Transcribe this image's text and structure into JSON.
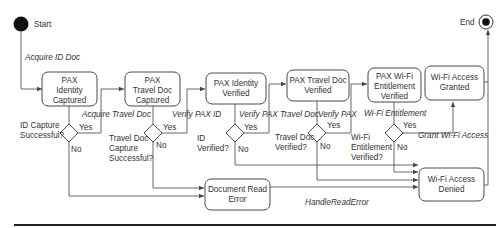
{
  "diagram": {
    "type": "uml-state-machine",
    "start": {
      "label": "Start"
    },
    "end": {
      "label": "End"
    },
    "states": [
      {
        "id": "s1",
        "lines": [
          "PAX",
          "Identity",
          "Captured"
        ]
      },
      {
        "id": "s2",
        "lines": [
          "PAX",
          "Travel Doc",
          "Captured"
        ]
      },
      {
        "id": "s3",
        "lines": [
          "PAX Identity",
          "Verified"
        ]
      },
      {
        "id": "s4",
        "lines": [
          "PAX Travel Doc",
          "Verified"
        ]
      },
      {
        "id": "s5",
        "lines": [
          "PAX Wi-Fi",
          "Entitlement",
          "Verified"
        ]
      },
      {
        "id": "s6",
        "lines": [
          "Wi-Fi Access",
          "Granted"
        ]
      },
      {
        "id": "err",
        "lines": [
          "Document Read",
          "Error"
        ]
      },
      {
        "id": "denied",
        "lines": [
          "Wi-Fi Access",
          "Denied"
        ]
      }
    ],
    "decisions": [
      {
        "id": "d1",
        "lines": [
          "ID Capture",
          "Successful?"
        ],
        "yes": "Yes",
        "no": "No"
      },
      {
        "id": "d2",
        "lines": [
          "Travel Doc",
          "Capture",
          "Successful?"
        ],
        "yes": "Yes",
        "no": "No"
      },
      {
        "id": "d3",
        "lines": [
          "ID",
          "Verified?"
        ],
        "yes": "Yes",
        "no": "No"
      },
      {
        "id": "d4",
        "lines": [
          "Travel Doc",
          "Verified?"
        ],
        "yes": "Yes",
        "no": "No"
      },
      {
        "id": "d5",
        "lines": [
          "Wi-Fi",
          "Entitlement",
          "Verified?"
        ],
        "yes": "Yes",
        "no": "No"
      }
    ],
    "transitions": {
      "acquire_id": "Acquire ID Doc",
      "acquire_travel": "Acquire Travel Doc",
      "verify_id": "Verify PAX ID",
      "verify_travel": "Verify PAX Travel Doc",
      "verify_pax": "Verify PAX",
      "wifi_entitlement": "Wi-Fi Entitlement",
      "grant_wifi": "Grant Wi-Fi Access",
      "handle_error": "HandleReadError"
    }
  }
}
